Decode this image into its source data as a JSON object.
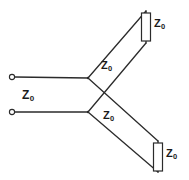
{
  "diagram": {
    "type": "circuit-schematic",
    "line_color": "#2b2b2b",
    "fill_color": "#ffffff",
    "background": "#ffffff",
    "labels": {
      "input_line": {
        "symbol": "Z",
        "subscript": "0",
        "text": "Z₀"
      },
      "branch_upper": {
        "symbol": "Z",
        "subscript": "0",
        "text": "Z₀"
      },
      "branch_lower": {
        "symbol": "Z",
        "subscript": "0",
        "text": "Z₀"
      },
      "terminator_upper": {
        "symbol": "Z",
        "subscript": "0",
        "text": "Z₀"
      },
      "terminator_lower": {
        "symbol": "Z",
        "subscript": "0",
        "text": "Z₀"
      }
    },
    "terminals": [
      {
        "name": "input-terminal-top",
        "x": 12,
        "y": 77
      },
      {
        "name": "input-terminal-bottom",
        "x": 12,
        "y": 112
      }
    ],
    "junctions": [
      {
        "name": "junction-upper",
        "x": 88,
        "y": 78
      },
      {
        "name": "junction-lower",
        "x": 88,
        "y": 112
      }
    ],
    "resistors": [
      {
        "name": "terminator-upper",
        "x": 141,
        "y": 13,
        "width": 9,
        "height": 28
      },
      {
        "name": "terminator-lower",
        "x": 153,
        "y": 143,
        "width": 9,
        "height": 28
      }
    ]
  }
}
